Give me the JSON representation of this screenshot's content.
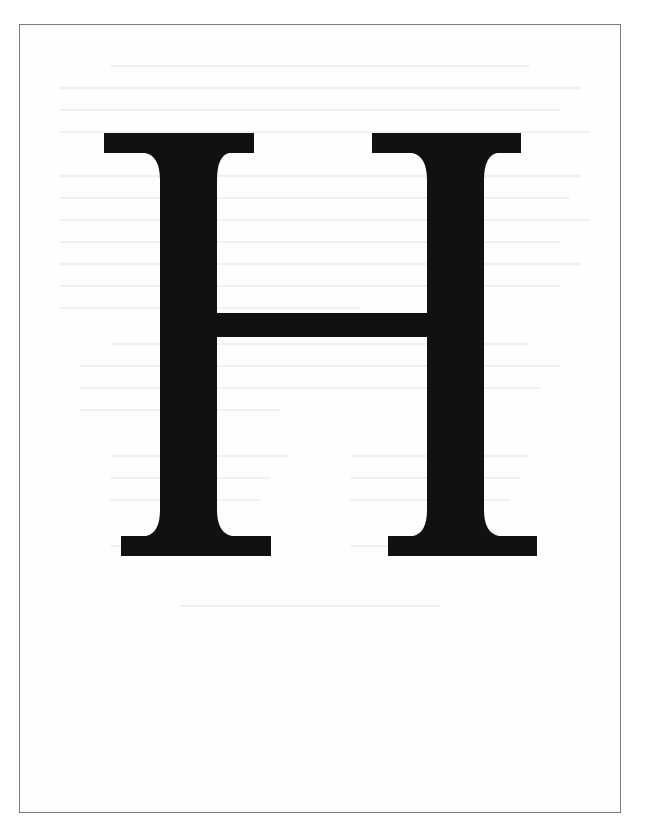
{
  "page": {
    "letter": "H",
    "ink_color": "#111111",
    "frame_color": "#7a7a7a",
    "background_color": "#ffffff"
  }
}
